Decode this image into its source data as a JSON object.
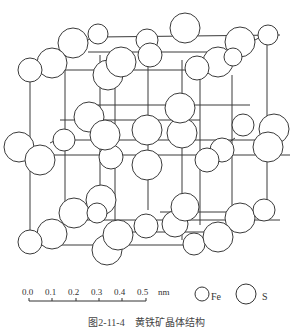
{
  "figure": {
    "caption": "图2-11-4　黄铁矿晶体结构"
  },
  "scale_bar": {
    "ticks": [
      "0.0",
      "0.1",
      "0.2",
      "0.3",
      "0.4",
      "0.5"
    ],
    "unit": "nm"
  },
  "legend": [
    {
      "symbol": "small-circle",
      "label": "Fe"
    },
    {
      "symbol": "large-circle",
      "label": "S"
    }
  ],
  "colors": {
    "line": "#3a3a3a",
    "atom_fill": "#ffffff",
    "background": "#ffffff"
  }
}
